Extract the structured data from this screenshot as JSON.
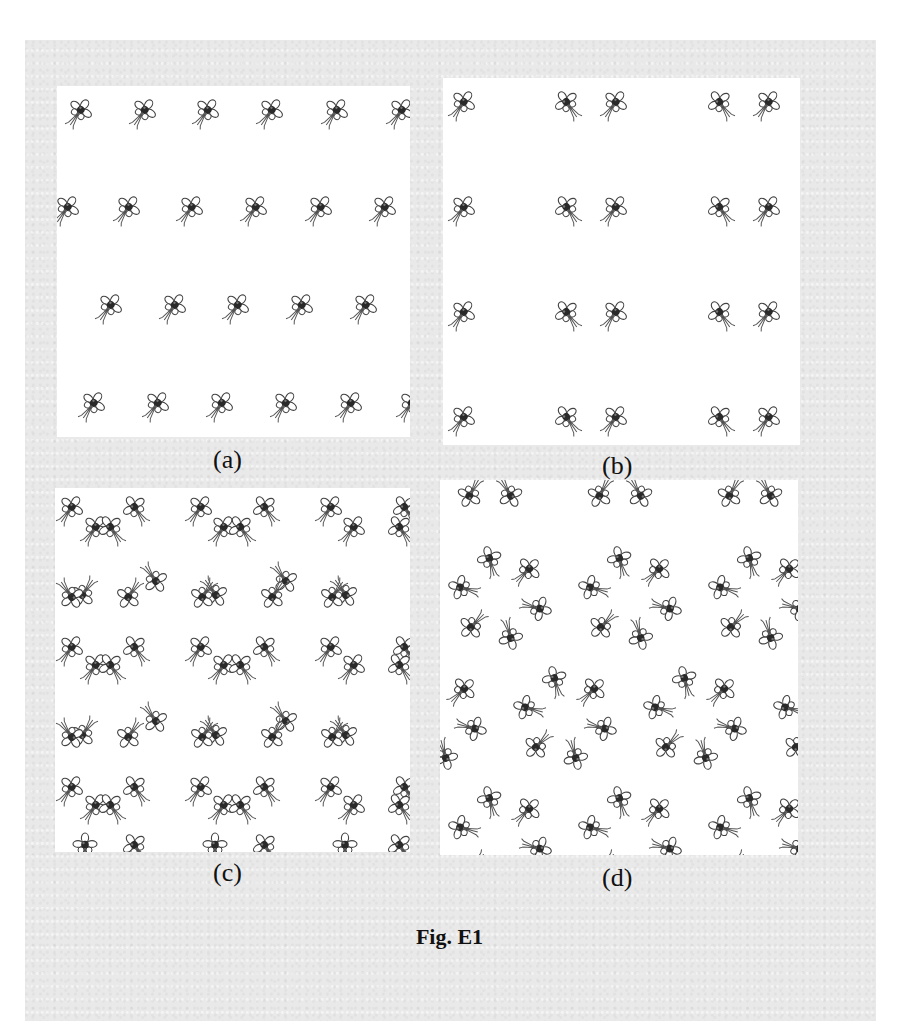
{
  "figure": {
    "caption": "Fig. E1",
    "motif_icon": "flower-stem-motif",
    "colors": {
      "page": "#e9e9e9",
      "panel": "#ffffff",
      "ink": "#2a2a2a"
    },
    "panels": [
      {
        "id": "a",
        "label": "(a)",
        "box": [
          57,
          86,
          353,
          351
        ],
        "label_pos": [
          213,
          447
        ],
        "description": "staggered rows of identically oriented motifs",
        "motifs": [
          [
            23,
            25,
            35
          ],
          [
            87,
            25,
            35
          ],
          [
            150,
            25,
            35
          ],
          [
            214,
            25,
            35
          ],
          [
            279,
            25,
            35
          ],
          [
            344,
            25,
            35
          ],
          [
            10,
            122,
            35
          ],
          [
            71,
            122,
            35
          ],
          [
            134,
            122,
            35
          ],
          [
            198,
            122,
            35
          ],
          [
            263,
            122,
            35
          ],
          [
            327,
            122,
            35
          ],
          [
            53,
            220,
            35
          ],
          [
            117,
            220,
            35
          ],
          [
            180,
            220,
            35
          ],
          [
            244,
            220,
            35
          ],
          [
            308,
            220,
            35
          ],
          [
            36,
            318,
            35
          ],
          [
            100,
            318,
            35
          ],
          [
            164,
            318,
            35
          ],
          [
            228,
            318,
            35
          ],
          [
            293,
            318,
            35
          ],
          [
            354,
            318,
            35
          ]
        ]
      },
      {
        "id": "b",
        "label": "(b)",
        "box": [
          443,
          78,
          357,
          367
        ],
        "label_pos": [
          602,
          453
        ],
        "description": "columns of mirrored motif pairs",
        "motifs": [
          [
            20,
            25,
            35
          ],
          [
            124,
            25,
            -35
          ],
          [
            172,
            25,
            35
          ],
          [
            277,
            25,
            -35
          ],
          [
            325,
            25,
            35
          ],
          [
            20,
            130,
            35
          ],
          [
            124,
            130,
            -35
          ],
          [
            172,
            130,
            35
          ],
          [
            277,
            130,
            -35
          ],
          [
            325,
            130,
            35
          ],
          [
            20,
            235,
            35
          ],
          [
            124,
            235,
            -35
          ],
          [
            172,
            235,
            35
          ],
          [
            277,
            235,
            -35
          ],
          [
            325,
            235,
            35
          ],
          [
            20,
            340,
            35
          ],
          [
            124,
            340,
            -35
          ],
          [
            172,
            340,
            35
          ],
          [
            277,
            340,
            -35
          ],
          [
            325,
            340,
            35
          ]
        ]
      },
      {
        "id": "c",
        "label": "(c)",
        "box": [
          55,
          488,
          355,
          364
        ],
        "label_pos": [
          213,
          860
        ],
        "description": "lattice of rotated motif pairs",
        "motifs": [
          [
            16,
            20,
            35
          ],
          [
            40,
            40,
            35
          ],
          [
            80,
            20,
            -35
          ],
          [
            56,
            40,
            -35
          ],
          [
            145,
            20,
            35
          ],
          [
            168,
            40,
            35
          ],
          [
            210,
            20,
            -35
          ],
          [
            186,
            40,
            -35
          ],
          [
            275,
            20,
            35
          ],
          [
            298,
            40,
            35
          ],
          [
            350,
            20,
            -35
          ],
          [
            345,
            40,
            -35
          ],
          [
            28,
            106,
            215
          ],
          [
            16,
            108,
            145
          ],
          [
            100,
            92,
            145
          ],
          [
            74,
            108,
            215
          ],
          [
            160,
            106,
            145
          ],
          [
            148,
            108,
            215
          ],
          [
            230,
            92,
            145
          ],
          [
            218,
            108,
            215
          ],
          [
            290,
            106,
            145
          ],
          [
            278,
            108,
            215
          ],
          [
            16,
            160,
            35
          ],
          [
            40,
            178,
            35
          ],
          [
            80,
            160,
            -35
          ],
          [
            56,
            178,
            -35
          ],
          [
            145,
            160,
            35
          ],
          [
            168,
            178,
            35
          ],
          [
            210,
            160,
            -35
          ],
          [
            186,
            178,
            -35
          ],
          [
            275,
            160,
            35
          ],
          [
            298,
            178,
            35
          ],
          [
            350,
            160,
            -35
          ],
          [
            345,
            178,
            -35
          ],
          [
            28,
            246,
            215
          ],
          [
            16,
            248,
            145
          ],
          [
            100,
            232,
            145
          ],
          [
            74,
            248,
            215
          ],
          [
            160,
            246,
            145
          ],
          [
            148,
            248,
            215
          ],
          [
            230,
            232,
            145
          ],
          [
            218,
            248,
            215
          ],
          [
            290,
            246,
            145
          ],
          [
            278,
            248,
            215
          ],
          [
            16,
            300,
            35
          ],
          [
            40,
            318,
            35
          ],
          [
            80,
            300,
            -35
          ],
          [
            56,
            318,
            -35
          ],
          [
            145,
            300,
            35
          ],
          [
            168,
            318,
            35
          ],
          [
            210,
            300,
            -35
          ],
          [
            186,
            318,
            -35
          ],
          [
            275,
            300,
            35
          ],
          [
            298,
            318,
            35
          ],
          [
            350,
            300,
            -35
          ],
          [
            345,
            318,
            -35
          ],
          [
            30,
            358,
            0
          ],
          [
            80,
            358,
            -35
          ],
          [
            160,
            358,
            0
          ],
          [
            210,
            358,
            -35
          ],
          [
            290,
            358,
            0
          ],
          [
            345,
            358,
            -35
          ]
        ]
      },
      {
        "id": "d",
        "label": "(d)",
        "box": [
          440,
          480,
          358,
          375
        ],
        "label_pos": [
          602,
          865
        ],
        "description": "hexagonal rings of six motifs",
        "rings": [
          {
            "cx": 50,
            "cy": -20,
            "r": 40,
            "start": 0
          },
          {
            "cx": 180,
            "cy": -20,
            "r": 40,
            "start": 0
          },
          {
            "cx": 310,
            "cy": -20,
            "r": 40,
            "start": 0
          },
          {
            "cx": 60,
            "cy": 118,
            "r": 40,
            "start": 15
          },
          {
            "cx": 190,
            "cy": 118,
            "r": 40,
            "start": 15
          },
          {
            "cx": 320,
            "cy": 118,
            "r": 40,
            "start": 15
          },
          {
            "cx": -5,
            "cy": 238,
            "r": 40,
            "start": 15
          },
          {
            "cx": 125,
            "cy": 238,
            "r": 40,
            "start": 15
          },
          {
            "cx": 255,
            "cy": 238,
            "r": 40,
            "start": 15
          },
          {
            "cx": 385,
            "cy": 238,
            "r": 40,
            "start": 15
          },
          {
            "cx": 60,
            "cy": 358,
            "r": 40,
            "start": 15
          },
          {
            "cx": 190,
            "cy": 358,
            "r": 40,
            "start": 15
          },
          {
            "cx": 320,
            "cy": 358,
            "r": 40,
            "start": 15
          }
        ]
      }
    ]
  }
}
